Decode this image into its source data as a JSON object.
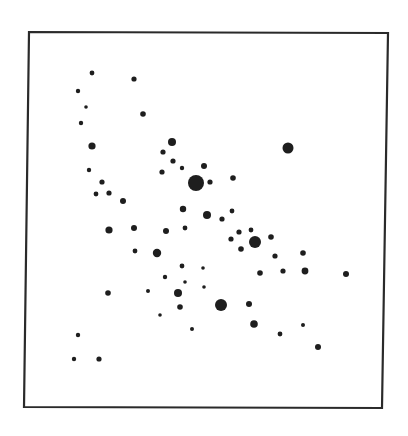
{
  "chart_data": {
    "type": "scatter",
    "title": "",
    "xlabel": "",
    "ylabel": "",
    "legend": [],
    "grid": false,
    "axes_ticks": "none",
    "frame": {
      "corners": [
        [
          29,
          32
        ],
        [
          388,
          33
        ],
        [
          382,
          408
        ],
        [
          24,
          407
        ]
      ],
      "color": "#2a2a2a"
    },
    "point_color": "#1e1e1e",
    "size_legend": "dot radius in px: tiny=1.8, small=2.6, medium=3.6, large=5, xlarge=8",
    "points": [
      {
        "x": 92,
        "y": 73,
        "r": 2.4
      },
      {
        "x": 134,
        "y": 79,
        "r": 2.6
      },
      {
        "x": 78,
        "y": 91,
        "r": 2.2
      },
      {
        "x": 86,
        "y": 107,
        "r": 1.8
      },
      {
        "x": 81,
        "y": 123,
        "r": 2.2
      },
      {
        "x": 143,
        "y": 114,
        "r": 2.8
      },
      {
        "x": 92,
        "y": 146,
        "r": 3.6
      },
      {
        "x": 172,
        "y": 142,
        "r": 4.0
      },
      {
        "x": 163,
        "y": 152,
        "r": 2.6
      },
      {
        "x": 173,
        "y": 161,
        "r": 2.6
      },
      {
        "x": 162,
        "y": 172,
        "r": 2.6
      },
      {
        "x": 182,
        "y": 168,
        "r": 2.2
      },
      {
        "x": 204,
        "y": 166,
        "r": 3.0
      },
      {
        "x": 196,
        "y": 183,
        "r": 8.0
      },
      {
        "x": 210,
        "y": 182,
        "r": 2.6
      },
      {
        "x": 233,
        "y": 178,
        "r": 2.8
      },
      {
        "x": 288,
        "y": 148,
        "r": 5.5
      },
      {
        "x": 89,
        "y": 170,
        "r": 2.2
      },
      {
        "x": 102,
        "y": 182,
        "r": 2.6
      },
      {
        "x": 96,
        "y": 194,
        "r": 2.4
      },
      {
        "x": 109,
        "y": 193,
        "r": 2.6
      },
      {
        "x": 123,
        "y": 201,
        "r": 3.0
      },
      {
        "x": 183,
        "y": 209,
        "r": 3.2
      },
      {
        "x": 207,
        "y": 215,
        "r": 4.0
      },
      {
        "x": 222,
        "y": 219,
        "r": 2.6
      },
      {
        "x": 232,
        "y": 211,
        "r": 2.4
      },
      {
        "x": 109,
        "y": 230,
        "r": 3.6
      },
      {
        "x": 134,
        "y": 228,
        "r": 3.0
      },
      {
        "x": 166,
        "y": 231,
        "r": 3.0
      },
      {
        "x": 185,
        "y": 228,
        "r": 2.4
      },
      {
        "x": 239,
        "y": 232,
        "r": 2.6
      },
      {
        "x": 251,
        "y": 230,
        "r": 2.4
      },
      {
        "x": 231,
        "y": 239,
        "r": 2.6
      },
      {
        "x": 255,
        "y": 242,
        "r": 6.0
      },
      {
        "x": 241,
        "y": 249,
        "r": 2.8
      },
      {
        "x": 271,
        "y": 237,
        "r": 2.8
      },
      {
        "x": 135,
        "y": 251,
        "r": 2.4
      },
      {
        "x": 157,
        "y": 253,
        "r": 4.2
      },
      {
        "x": 275,
        "y": 256,
        "r": 2.6
      },
      {
        "x": 303,
        "y": 253,
        "r": 2.8
      },
      {
        "x": 182,
        "y": 266,
        "r": 2.4
      },
      {
        "x": 203,
        "y": 268,
        "r": 1.8
      },
      {
        "x": 165,
        "y": 277,
        "r": 2.2
      },
      {
        "x": 185,
        "y": 282,
        "r": 1.8
      },
      {
        "x": 204,
        "y": 287,
        "r": 1.8
      },
      {
        "x": 260,
        "y": 273,
        "r": 2.8
      },
      {
        "x": 283,
        "y": 271,
        "r": 2.6
      },
      {
        "x": 305,
        "y": 271,
        "r": 3.4
      },
      {
        "x": 346,
        "y": 274,
        "r": 3.0
      },
      {
        "x": 108,
        "y": 293,
        "r": 2.8
      },
      {
        "x": 148,
        "y": 291,
        "r": 2.0
      },
      {
        "x": 178,
        "y": 293,
        "r": 4.0
      },
      {
        "x": 180,
        "y": 307,
        "r": 2.8
      },
      {
        "x": 160,
        "y": 315,
        "r": 1.8
      },
      {
        "x": 221,
        "y": 305,
        "r": 6.0
      },
      {
        "x": 249,
        "y": 304,
        "r": 3.0
      },
      {
        "x": 192,
        "y": 329,
        "r": 2.0
      },
      {
        "x": 254,
        "y": 324,
        "r": 3.8
      },
      {
        "x": 280,
        "y": 334,
        "r": 2.4
      },
      {
        "x": 303,
        "y": 325,
        "r": 2.0
      },
      {
        "x": 318,
        "y": 347,
        "r": 3.0
      },
      {
        "x": 78,
        "y": 335,
        "r": 2.2
      },
      {
        "x": 74,
        "y": 359,
        "r": 2.2
      },
      {
        "x": 99,
        "y": 359,
        "r": 2.6
      }
    ]
  }
}
